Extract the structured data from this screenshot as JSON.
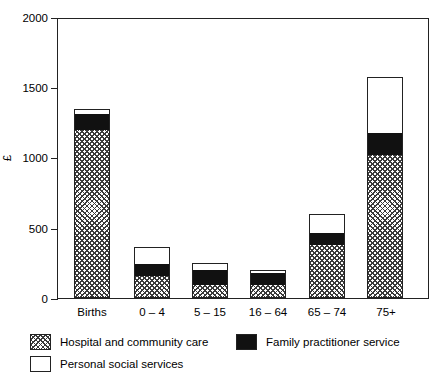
{
  "chart_data": {
    "type": "bar",
    "subtype": "stacked-vertical",
    "title": "",
    "xlabel": "",
    "ylabel": "£",
    "ylim": [
      0,
      2000
    ],
    "yticks": [
      0,
      500,
      1000,
      1500,
      2000
    ],
    "ytick_labels": [
      "0",
      "500",
      "1000",
      "1500",
      "2000"
    ],
    "grid": false,
    "legend_position": "below-plot",
    "categories": [
      "Births",
      "0 – 4",
      "5 – 15",
      "16 – 64",
      "65 – 74",
      "75+"
    ],
    "series": [
      {
        "name": "Hospital and community care",
        "fill": "crosshatch",
        "values": [
          1195,
          156,
          92,
          92,
          377,
          1017
        ]
      },
      {
        "name": "Family practitioner service",
        "fill": "black",
        "values": [
          115,
          85,
          107,
          85,
          85,
          156
        ]
      },
      {
        "name": "Personal social services",
        "fill": "white",
        "values": [
          35,
          120,
          50,
          21,
          135,
          399
        ]
      }
    ],
    "totals": [
      1345,
      361,
      249,
      198,
      597,
      1572
    ]
  },
  "axis": {
    "y_label": "£",
    "y_tick_labels": [
      "2000",
      "1500",
      "1000",
      "500",
      "0"
    ]
  },
  "x_axis": {
    "labels": [
      "Births",
      "0 – 4",
      "5 – 15",
      "16 – 64",
      "65 – 74",
      "75+"
    ]
  },
  "legend": {
    "items": [
      {
        "label": "Hospital and community care",
        "swatch": "crosshatch"
      },
      {
        "label": "Family practitioner service",
        "swatch": "black"
      },
      {
        "label": "Personal social services",
        "swatch": "white"
      }
    ]
  },
  "colors": {
    "axis": "#222222",
    "hatch": "#3a3a3a",
    "black_fill": "#111111",
    "white_fill": "#ffffff",
    "background": "#ffffff"
  }
}
